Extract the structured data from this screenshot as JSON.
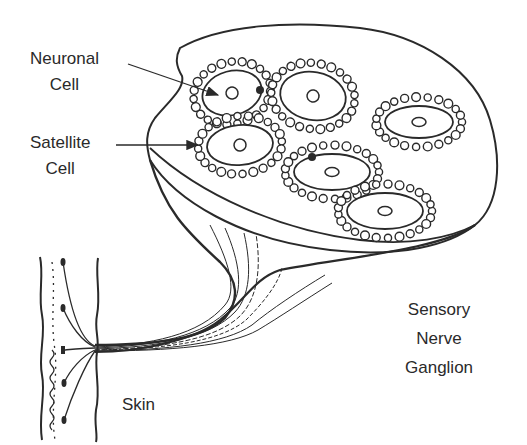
{
  "diagram": {
    "colors": {
      "ink": "#2a2a2a",
      "background": "#ffffff"
    },
    "labels": {
      "neuronal_cell": {
        "line1": "Neuronal",
        "line2": "Cell"
      },
      "satellite_cell": {
        "line1": "Satellite",
        "line2": "Cell"
      },
      "sensory_nerve_ganglion": {
        "line1": "Sensory",
        "line2": "Nerve",
        "line3": "Ganglion"
      },
      "skin": {
        "text": "Skin"
      }
    },
    "cells": [
      {
        "id": "cell-1",
        "cx": 232,
        "cy": 93,
        "rx": 30,
        "ry": 22,
        "rot": -15
      },
      {
        "id": "cell-2",
        "cx": 313,
        "cy": 96,
        "rx": 33,
        "ry": 24,
        "rot": 10
      },
      {
        "id": "cell-3",
        "cx": 419,
        "cy": 122,
        "rx": 34,
        "ry": 16,
        "rot": 0
      },
      {
        "id": "cell-4",
        "cx": 240,
        "cy": 145,
        "rx": 33,
        "ry": 20,
        "rot": -5
      },
      {
        "id": "cell-5",
        "cx": 332,
        "cy": 172,
        "rx": 38,
        "ry": 18,
        "rot": 0
      },
      {
        "id": "cell-6",
        "cx": 385,
        "cy": 211,
        "rx": 38,
        "ry": 18,
        "rot": 0
      }
    ]
  }
}
